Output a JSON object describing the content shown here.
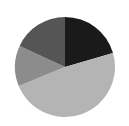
{
  "chart_data": {
    "type": "pie",
    "title": "",
    "start_angle_deg": 0,
    "direction": "clockwise",
    "legend": "none",
    "labels_visible": false,
    "slices": [
      {
        "name": "slice-1",
        "value": 20.5,
        "color": "#1a1a1a"
      },
      {
        "name": "slice-2",
        "value": 48.3,
        "color": "#b4b4b4"
      },
      {
        "name": "slice-3",
        "value": 13.1,
        "color": "#8c8c8c"
      },
      {
        "name": "slice-4",
        "value": 18.1,
        "color": "#555555"
      }
    ],
    "values": [
      20.5,
      48.3,
      13.1,
      18.1
    ],
    "categories": [
      "slice-1",
      "slice-2",
      "slice-3",
      "slice-4"
    ]
  },
  "layout": {
    "center_x": 65,
    "center_y": 67,
    "radius": 50,
    "background": "#ffffff"
  }
}
